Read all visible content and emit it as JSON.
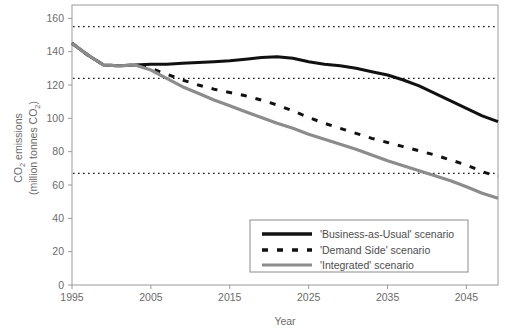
{
  "chart_data": {
    "type": "line",
    "title": "",
    "xlabel": "Year",
    "ylabel": "CO2 emissions (million tonnes CO2)",
    "ylabel_line1": "CO",
    "ylabel_line1_sub": "2",
    "ylabel_line1_rest": " emissions",
    "ylabel_line2": "(million tonnes CO",
    "ylabel_line2_sub": "2",
    "ylabel_line2_rest": ")",
    "xlim": [
      1995,
      2049
    ],
    "ylim": [
      0,
      168
    ],
    "grid": false,
    "legend_position": "bottom-right",
    "xticks": [
      1995,
      2005,
      2015,
      2025,
      2035,
      2045
    ],
    "xticklabels": [
      "1995",
      "2005",
      "2015",
      "2025",
      "2035",
      "2045"
    ],
    "yticks": [
      0,
      20,
      40,
      60,
      80,
      100,
      120,
      140,
      160
    ],
    "yticklabels": [
      "0",
      "20",
      "40",
      "60",
      "80",
      "100",
      "120",
      "140",
      "160"
    ],
    "reference_lines": [
      {
        "name": "upper-target-line",
        "value": 155,
        "style": "dotted"
      },
      {
        "name": "middle-target-line",
        "value": 124,
        "style": "dotted"
      },
      {
        "name": "lower-target-line",
        "value": 67,
        "style": "dotted"
      }
    ],
    "x": [
      1995,
      1997,
      1999,
      2001,
      2003,
      2005,
      2007,
      2009,
      2011,
      2013,
      2015,
      2017,
      2019,
      2021,
      2023,
      2025,
      2027,
      2029,
      2031,
      2033,
      2035,
      2037,
      2039,
      2041,
      2043,
      2045,
      2047,
      2049
    ],
    "series": [
      {
        "name": "'Business-as-Usual' scenario",
        "color": "#111111",
        "style": "solid",
        "width": 3.0,
        "values": [
          145,
          138,
          132,
          131.5,
          132,
          132.5,
          132.5,
          133,
          133.5,
          134,
          134.5,
          135.5,
          136.5,
          137,
          136,
          134,
          132.5,
          131.5,
          130,
          128,
          126,
          123,
          119.5,
          115,
          110.5,
          106,
          101.5,
          98
        ]
      },
      {
        "name": "'Demand Side' scenario",
        "color": "#111111",
        "style": "dashed",
        "width": 3.0,
        "values": [
          145,
          138,
          132,
          131.5,
          132,
          130,
          126.5,
          123,
          120,
          117.5,
          115.5,
          113.5,
          111,
          108,
          104.5,
          100.5,
          97,
          94,
          91,
          88,
          85.5,
          83,
          80.5,
          78,
          75,
          72,
          68,
          65
        ]
      },
      {
        "name": "'Integrated' scenario",
        "color": "#8c8c8c",
        "style": "solid",
        "width": 3.2,
        "values": [
          145,
          138,
          132,
          131.5,
          132,
          129,
          124,
          119,
          115,
          111,
          107.5,
          104,
          100.5,
          97,
          94,
          90.5,
          87.5,
          84.5,
          81.5,
          78,
          74.5,
          71.5,
          68.5,
          65.5,
          62.5,
          59,
          55,
          52
        ]
      }
    ]
  },
  "legend": {
    "items": [
      {
        "label": "'Business-as-Usual' scenario",
        "key": "business-as-usual"
      },
      {
        "label": "'Demand Side' scenario",
        "key": "demand-side"
      },
      {
        "label": "'Integrated' scenario",
        "key": "integrated"
      }
    ]
  }
}
